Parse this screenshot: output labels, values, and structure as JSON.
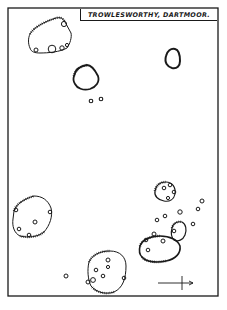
{
  "map": {
    "title": "TROWLESWORTHY, DARTMOOR.",
    "style": {
      "ink": "#1a1a1a",
      "paper": "#ffffff"
    },
    "frame": {
      "x": 8,
      "y": 8,
      "width": 210,
      "height": 288
    },
    "compass": {
      "type": "north-east-arrow-cross",
      "x": 180,
      "y": 283
    },
    "enclosures": [
      {
        "id": "enclosure-northwest",
        "label": "hut enclosure (top-left)",
        "cx": 50,
        "cy": 38
      },
      {
        "id": "enclosure-upper-middle",
        "label": "small pound",
        "cx": 87,
        "cy": 78
      },
      {
        "id": "enclosure-northeast",
        "label": "small pound (top-right)",
        "cx": 172,
        "cy": 59
      },
      {
        "id": "enclosure-east-small",
        "label": "pound with huts",
        "cx": 164,
        "cy": 192
      },
      {
        "id": "enclosure-west",
        "label": "pound with huts (left)",
        "cx": 31,
        "cy": 215
      },
      {
        "id": "enclosure-east-large",
        "label": "large pound (right)",
        "cx": 158,
        "cy": 248
      },
      {
        "id": "enclosure-east-annex",
        "label": "annex pound",
        "cx": 180,
        "cy": 230
      },
      {
        "id": "enclosure-south",
        "label": "pound (bottom middle)",
        "cx": 109,
        "cy": 278
      }
    ],
    "huts_count_outside": 11
  }
}
